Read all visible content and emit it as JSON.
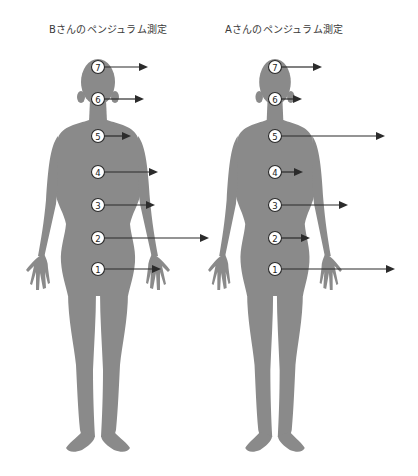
{
  "figures": [
    {
      "id": "B",
      "title": "Bさんのペンジュラム測定",
      "center_x": 98,
      "markers": [
        {
          "label": "7",
          "y": 67,
          "arrow_end_x": 148
        },
        {
          "label": "6",
          "y": 99,
          "arrow_end_x": 144
        },
        {
          "label": "5",
          "y": 136,
          "arrow_end_x": 131
        },
        {
          "label": "4",
          "y": 172,
          "arrow_end_x": 158
        },
        {
          "label": "3",
          "y": 205,
          "arrow_end_x": 155
        },
        {
          "label": "2",
          "y": 238,
          "arrow_end_x": 209
        },
        {
          "label": "1",
          "y": 269,
          "arrow_end_x": 161
        }
      ]
    },
    {
      "id": "A",
      "title": "Aさんのペンジュラム測定",
      "center_x": 275,
      "markers": [
        {
          "label": "7",
          "y": 67,
          "arrow_end_x": 322
        },
        {
          "label": "6",
          "y": 99,
          "arrow_end_x": 302
        },
        {
          "label": "5",
          "y": 136,
          "arrow_end_x": 385
        },
        {
          "label": "4",
          "y": 172,
          "arrow_end_x": 303
        },
        {
          "label": "3",
          "y": 205,
          "arrow_end_x": 348
        },
        {
          "label": "2",
          "y": 238,
          "arrow_end_x": 310
        },
        {
          "label": "1",
          "y": 269,
          "arrow_end_x": 395
        }
      ]
    }
  ],
  "colors": {
    "body": "#8a8a8a",
    "arrow": "#2b2b2b",
    "marker_fill": "#ffffff",
    "marker_stroke": "#2a2a2a",
    "title_text": "#3a3a3a"
  }
}
